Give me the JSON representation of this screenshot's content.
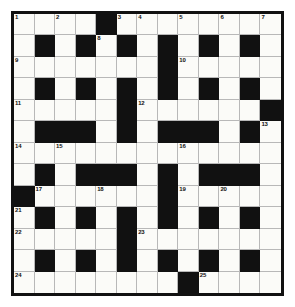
{
  "puzzle": {
    "type": "crossword-grid",
    "title": "Crossword Puzzle Grid",
    "rows": 13,
    "columns": 13,
    "colors": {
      "block": "#111111",
      "cell": "#fbfbf8",
      "grid_line": "#b8b8b8",
      "frame": "#111111",
      "number_text": "#111111",
      "page_background": "#ffffff"
    },
    "black_cells": [
      [
        1,
        5
      ],
      [
        2,
        2
      ],
      [
        2,
        4
      ],
      [
        2,
        6
      ],
      [
        2,
        8
      ],
      [
        2,
        10
      ],
      [
        2,
        12
      ],
      [
        3,
        8
      ],
      [
        4,
        2
      ],
      [
        4,
        4
      ],
      [
        4,
        6
      ],
      [
        4,
        8
      ],
      [
        4,
        10
      ],
      [
        4,
        12
      ],
      [
        5,
        6
      ],
      [
        5,
        13
      ],
      [
        6,
        2
      ],
      [
        6,
        3
      ],
      [
        6,
        4
      ],
      [
        6,
        6
      ],
      [
        6,
        8
      ],
      [
        6,
        9
      ],
      [
        6,
        10
      ],
      [
        6,
        12
      ],
      [
        8,
        2
      ],
      [
        8,
        4
      ],
      [
        8,
        5
      ],
      [
        8,
        6
      ],
      [
        8,
        8
      ],
      [
        8,
        10
      ],
      [
        8,
        11
      ],
      [
        8,
        12
      ],
      [
        9,
        1
      ],
      [
        9,
        8
      ],
      [
        10,
        2
      ],
      [
        10,
        4
      ],
      [
        10,
        6
      ],
      [
        10,
        8
      ],
      [
        10,
        10
      ],
      [
        10,
        12
      ],
      [
        11,
        6
      ],
      [
        12,
        2
      ],
      [
        12,
        4
      ],
      [
        12,
        6
      ],
      [
        12,
        8
      ],
      [
        12,
        10
      ],
      [
        12,
        12
      ],
      [
        13,
        9
      ]
    ],
    "clue_numbers": [
      {
        "number": "1",
        "row": 1,
        "col": 1
      },
      {
        "number": "2",
        "row": 1,
        "col": 3
      },
      {
        "number": "3",
        "row": 1,
        "col": 6
      },
      {
        "number": "4",
        "row": 1,
        "col": 7
      },
      {
        "number": "5",
        "row": 1,
        "col": 9
      },
      {
        "number": "6",
        "row": 1,
        "col": 11
      },
      {
        "number": "7",
        "row": 1,
        "col": 13
      },
      {
        "number": "8",
        "row": 2,
        "col": 5
      },
      {
        "number": "9",
        "row": 3,
        "col": 1
      },
      {
        "number": "10",
        "row": 3,
        "col": 9
      },
      {
        "number": "11",
        "row": 5,
        "col": 1
      },
      {
        "number": "12",
        "row": 5,
        "col": 7
      },
      {
        "number": "13",
        "row": 6,
        "col": 13
      },
      {
        "number": "14",
        "row": 7,
        "col": 1
      },
      {
        "number": "15",
        "row": 7,
        "col": 3
      },
      {
        "number": "16",
        "row": 7,
        "col": 9
      },
      {
        "number": "17",
        "row": 9,
        "col": 2
      },
      {
        "number": "18",
        "row": 9,
        "col": 5
      },
      {
        "number": "19",
        "row": 9,
        "col": 9
      },
      {
        "number": "20",
        "row": 9,
        "col": 11
      },
      {
        "number": "21",
        "row": 10,
        "col": 1
      },
      {
        "number": "22",
        "row": 11,
        "col": 1
      },
      {
        "number": "23",
        "row": 11,
        "col": 7
      },
      {
        "number": "24",
        "row": 13,
        "col": 1
      },
      {
        "number": "25",
        "row": 13,
        "col": 10
      }
    ],
    "entries": []
  }
}
